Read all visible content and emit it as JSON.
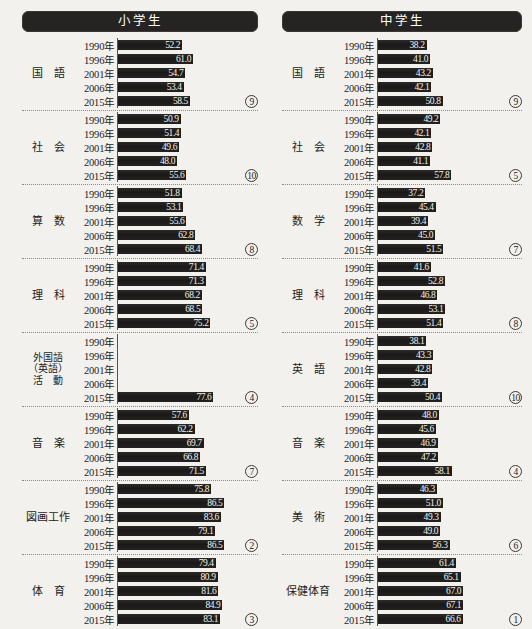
{
  "chart_data": {
    "type": "bar",
    "xlabel": "",
    "ylabel": "",
    "xlim": [
      0,
      100
    ],
    "grid": false,
    "legend": "none",
    "categories": [
      "1990年",
      "1996年",
      "2001年",
      "2006年",
      "2015年"
    ],
    "panels": [
      {
        "name": "小学生",
        "groups": [
          {
            "subject": "国　語",
            "values": [
              52.2,
              61.0,
              54.7,
              53.4,
              58.5
            ],
            "rank": "⑨"
          },
          {
            "subject": "社　会",
            "values": [
              50.9,
              51.4,
              49.6,
              48.0,
              55.6
            ],
            "rank": "⑩"
          },
          {
            "subject": "算　数",
            "values": [
              51.8,
              53.1,
              55.6,
              62.8,
              68.4
            ],
            "rank": "⑧"
          },
          {
            "subject": "理　科",
            "values": [
              71.4,
              71.3,
              68.2,
              68.5,
              75.2
            ],
            "rank": "⑤"
          },
          {
            "subject": "外国語（英語）活動",
            "values": [
              null,
              null,
              null,
              null,
              77.6
            ],
            "rank": "④"
          },
          {
            "subject": "音　楽",
            "values": [
              57.6,
              62.2,
              69.7,
              66.8,
              71.5
            ],
            "rank": "⑦"
          },
          {
            "subject": "図画工作",
            "values": [
              75.8,
              86.5,
              83.6,
              79.1,
              86.5
            ],
            "rank": "②"
          },
          {
            "subject": "体　育",
            "values": [
              79.4,
              80.9,
              81.6,
              84.9,
              83.1
            ],
            "rank": "③"
          }
        ]
      },
      {
        "name": "中学生",
        "groups": [
          {
            "subject": "国　語",
            "values": [
              38.2,
              41.0,
              43.2,
              42.1,
              50.8
            ],
            "rank": "⑨"
          },
          {
            "subject": "社　会",
            "values": [
              49.2,
              42.1,
              42.8,
              41.1,
              57.8
            ],
            "rank": "⑤"
          },
          {
            "subject": "数　学",
            "values": [
              37.2,
              45.4,
              39.4,
              45.0,
              51.5
            ],
            "rank": "⑦"
          },
          {
            "subject": "理　科",
            "values": [
              41.6,
              52.8,
              46.8,
              53.1,
              51.4
            ],
            "rank": "⑧"
          },
          {
            "subject": "英　語",
            "values": [
              38.1,
              43.3,
              42.8,
              39.4,
              50.4
            ],
            "rank": "⑩"
          },
          {
            "subject": "音　楽",
            "values": [
              48.0,
              45.6,
              46.9,
              47.2,
              58.1
            ],
            "rank": "④"
          },
          {
            "subject": "美　術",
            "values": [
              46.3,
              51.0,
              49.3,
              49.0,
              56.3
            ],
            "rank": "⑥"
          },
          {
            "subject": "保健体育",
            "values": [
              61.4,
              65.1,
              67.0,
              67.1,
              66.6
            ],
            "rank": "①"
          }
        ]
      }
    ]
  },
  "style": {
    "bar_color": "#211f1d",
    "header_bg": "#262422",
    "page_bg": "#f2f1ee",
    "text_color": "#1c1c1c",
    "bar_value_color": "#f4f3f0"
  }
}
